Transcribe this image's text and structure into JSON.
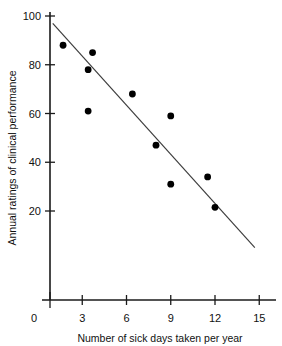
{
  "chart_data": {
    "type": "scatter",
    "title": "",
    "xlabel": "Number of sick days taken per year",
    "ylabel": "Annual ratings of clinical performance",
    "xlim": [
      0,
      15.6
    ],
    "ylim": [
      0,
      104
    ],
    "xticks": [
      0,
      3,
      6,
      9,
      12,
      15
    ],
    "xtick_labels": [
      "0",
      "3",
      "6",
      "9",
      "12",
      "15"
    ],
    "yticks": [
      20,
      40,
      60,
      80,
      100
    ],
    "ytick_labels": [
      "20",
      "40",
      "60",
      "80",
      "100"
    ],
    "grid": false,
    "legend": "none",
    "point_color": "#000000",
    "line_color": "#3d3d3d",
    "axis_color": "#1a1a1a",
    "points": [
      {
        "x": 1.7,
        "y": 88
      },
      {
        "x": 3.4,
        "y": 78
      },
      {
        "x": 3.7,
        "y": 85
      },
      {
        "x": 3.4,
        "y": 61
      },
      {
        "x": 6.4,
        "y": 68
      },
      {
        "x": 8.0,
        "y": 47
      },
      {
        "x": 9.0,
        "y": 59
      },
      {
        "x": 9.0,
        "y": 31
      },
      {
        "x": 11.5,
        "y": 34
      },
      {
        "x": 12.0,
        "y": 21.5
      }
    ],
    "trend_line": {
      "x_start": 1.0,
      "y_start": 97,
      "x_end": 14.7,
      "y_end": 5
    }
  }
}
